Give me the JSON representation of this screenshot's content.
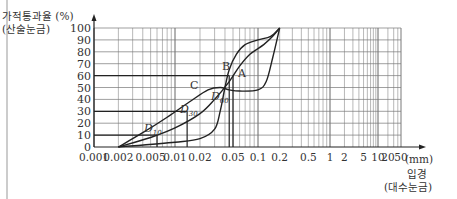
{
  "chart_data": {
    "type": "line",
    "title": "",
    "ylabel": "가적통과율 (%)",
    "ylabel_sub": "(산술눈금)",
    "xlabel": "입경",
    "xlabel_sub": "(대수눈금)",
    "x_unit": "(mm)",
    "x_scale": "log",
    "ylim": [
      0,
      100
    ],
    "xlim": [
      0.001,
      50
    ],
    "y_ticks": [
      "0",
      "10",
      "20",
      "30",
      "40",
      "50",
      "60",
      "70",
      "80",
      "90",
      "100"
    ],
    "x_ticks": [
      "0.001",
      "0.002",
      "0.005",
      "0.01",
      "0.02",
      "0.05",
      "0.1",
      "0.2",
      "0.5",
      "1",
      "2",
      "5",
      "10",
      "20",
      "50"
    ],
    "grid": true,
    "series": [
      {
        "name": "A",
        "points": [
          [
            0.002,
            0
          ],
          [
            0.005,
            8
          ],
          [
            0.01,
            16
          ],
          [
            0.02,
            28
          ],
          [
            0.03,
            40
          ],
          [
            0.045,
            55
          ],
          [
            0.06,
            68
          ],
          [
            0.08,
            78
          ],
          [
            0.12,
            86
          ],
          [
            0.16,
            93
          ],
          [
            0.2,
            100
          ]
        ]
      },
      {
        "name": "B",
        "points": [
          [
            0.002,
            0
          ],
          [
            0.01,
            4
          ],
          [
            0.02,
            7
          ],
          [
            0.03,
            15
          ],
          [
            0.035,
            30
          ],
          [
            0.04,
            50
          ],
          [
            0.045,
            65
          ],
          [
            0.055,
            78
          ],
          [
            0.07,
            86
          ],
          [
            0.1,
            90
          ],
          [
            0.15,
            93
          ],
          [
            0.2,
            100
          ]
        ]
      },
      {
        "name": "C",
        "points": [
          [
            0.002,
            0
          ],
          [
            0.004,
            12
          ],
          [
            0.008,
            25
          ],
          [
            0.015,
            38
          ],
          [
            0.025,
            48
          ],
          [
            0.035,
            50
          ],
          [
            0.045,
            48
          ],
          [
            0.06,
            47
          ],
          [
            0.1,
            48
          ],
          [
            0.13,
            55
          ],
          [
            0.16,
            75
          ],
          [
            0.2,
            100
          ]
        ]
      }
    ],
    "annotations": [
      {
        "label": "D10",
        "x": 0.006,
        "y": 10
      },
      {
        "label": "D30",
        "x": 0.014,
        "y": 30
      },
      {
        "label": "D60",
        "x": 0.045,
        "y": 60
      },
      {
        "label": "A",
        "x": 0.075,
        "y": 80
      },
      {
        "label": "B",
        "x": 0.045,
        "y": 83
      },
      {
        "label": "C",
        "x": 0.02,
        "y": 55
      }
    ],
    "reference_lines": {
      "horizontal": [
        10,
        30,
        60
      ],
      "vertical_at_x": [
        0.006,
        0.014,
        0.045,
        0.05
      ]
    }
  },
  "labels": {
    "y_title": "가적통과율 (%)",
    "y_sub": "(산술눈금)",
    "x_title": "입경",
    "x_sub": "(대수눈금)",
    "x_unit": "(mm)",
    "curve_a": "A",
    "curve_b": "B",
    "curve_c": "C",
    "d10": "D",
    "d10_sub": "10",
    "d30": "D",
    "d30_sub": "30",
    "d60": "D",
    "d60_sub": "60"
  }
}
